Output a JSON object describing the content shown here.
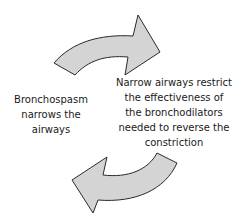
{
  "diagram": {
    "type": "cycle",
    "nodes": [
      {
        "id": "bronchospasm",
        "lines": [
          "Bronchospasm",
          "narrows the",
          "airways"
        ]
      },
      {
        "id": "narrow-airways",
        "lines": [
          "Narrow airways restrict",
          "the effectiveness of",
          "the bronchodilators",
          "needed to reverse the",
          "constriction"
        ]
      }
    ],
    "edges": [
      {
        "from": "bronchospasm",
        "to": "narrow-airways",
        "icon": "curved-arrow-right-icon"
      },
      {
        "from": "narrow-airways",
        "to": "bronchospasm",
        "icon": "curved-arrow-left-icon"
      }
    ],
    "colors": {
      "arrow_fill": "#d4d4d4",
      "arrow_stroke": "#2a2a2a",
      "text": "#1a1a1a",
      "background": "#ffffff"
    }
  }
}
